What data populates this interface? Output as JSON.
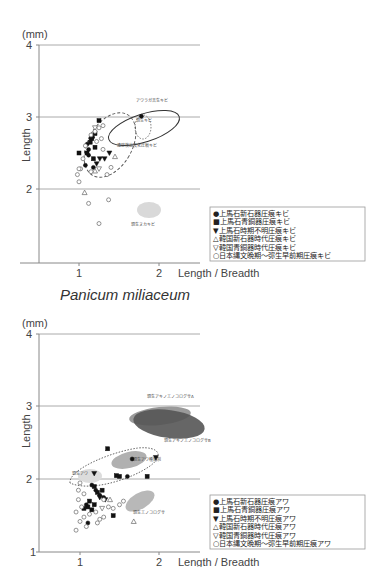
{
  "chart_data": [
    {
      "type": "scatter",
      "title": "Panicum miliaceum",
      "unit": "(mm)",
      "xlabel": "Length / Breadth",
      "ylabel": "Length",
      "xlim": [
        0.5,
        2.5
      ],
      "ylim": [
        1,
        4
      ],
      "xticks": [
        "1",
        "2"
      ],
      "yticks": [
        "4",
        "3",
        "2"
      ],
      "grid": "horizontal at 2, 3, 4",
      "legend_position": "right-lower",
      "legend": [
        "●上馬石新石器圧痕キビ",
        "■上馬石青銅器圧痕キビ",
        "▼上馬石時期不明圧痕キビ",
        "△韓国新石器時代圧痕キビ",
        "▽韓国青銅器時代圧痕キビ",
        "○日本縄文晩期～弥生早前期圧痕キビ"
      ],
      "annotations": [
        {
          "text": "アワラガ吉生キビ",
          "type": "solid ellipse",
          "cx": 1.75,
          "cy": 2.92,
          "rx": 0.36,
          "ry": 0.2
        },
        {
          "text": "現生キビ",
          "type": "dotted ellipse",
          "cx": 1.78,
          "cy": 2.87,
          "rx": 0.09,
          "ry": 0.16
        },
        {
          "text": "遺跡検出炭化圧痕キビ",
          "type": "dashed ellipse",
          "cx": 1.38,
          "cy": 2.6,
          "rx": 0.32,
          "ry": 0.38
        },
        {
          "text": "現生ヌカキビ",
          "type": "filled grey ellipse",
          "cx": 1.88,
          "cy": 1.75,
          "rx": 0.12,
          "ry": 0.07
        }
      ],
      "series": [
        {
          "name": "上馬石新石器圧痕キビ",
          "marker": "filled-circle",
          "points": [
            [
              1.78,
              3.01
            ],
            [
              1.12,
              2.47
            ],
            [
              1.18,
              2.3
            ],
            [
              1.1,
              2.62
            ],
            [
              1.15,
              2.7
            ],
            [
              1.17,
              2.72
            ],
            [
              1.12,
              2.55
            ],
            [
              1.08,
              2.33
            ]
          ]
        },
        {
          "name": "上馬石青銅器圧痕キビ",
          "marker": "filled-square",
          "points": [
            [
              1.25,
              2.95
            ],
            [
              1.2,
              2.77
            ],
            [
              1.16,
              2.7
            ],
            [
              1.14,
              2.65
            ],
            [
              1.1,
              2.5
            ],
            [
              1.2,
              2.58
            ],
            [
              1.0,
              2.5
            ],
            [
              1.18,
              2.42
            ]
          ]
        },
        {
          "name": "上馬石時期不明圧痕キビ",
          "marker": "filled-triangle-down",
          "points": [
            [
              1.32,
              2.42
            ],
            [
              1.38,
              2.5
            ],
            [
              1.22,
              2.35
            ],
            [
              1.26,
              2.42
            ]
          ]
        },
        {
          "name": "韓国新石器時代圧痕キビ",
          "marker": "open-triangle-up",
          "points": [
            [
              1.07,
              1.95
            ],
            [
              1.45,
              2.45
            ],
            [
              1.2,
              2.25
            ]
          ]
        },
        {
          "name": "韓国青銅器時代圧痕キビ",
          "marker": "open-triangle-down",
          "points": [
            [
              1.2,
              2.85
            ],
            [
              1.25,
              2.28
            ]
          ]
        },
        {
          "name": "日本縄文晩期～弥生早前期圧痕キビ",
          "marker": "open-circle",
          "points": [
            [
              1.25,
              2.85
            ],
            [
              1.3,
              2.88
            ],
            [
              1.2,
              2.8
            ],
            [
              1.15,
              2.75
            ],
            [
              1.28,
              2.7
            ],
            [
              1.22,
              2.66
            ],
            [
              1.05,
              2.42
            ],
            [
              1.02,
              2.28
            ],
            [
              1.0,
              2.28
            ],
            [
              0.98,
              2.2
            ],
            [
              1.15,
              2.24
            ],
            [
              1.3,
              2.55
            ],
            [
              1.35,
              2.2
            ],
            [
              1.08,
              2.6
            ],
            [
              1.0,
              2.1
            ],
            [
              1.12,
              1.8
            ],
            [
              1.37,
              1.85
            ],
            [
              1.25,
              1.52
            ],
            [
              1.4,
              2.3
            ]
          ]
        }
      ]
    },
    {
      "type": "scatter",
      "title": "",
      "unit": "(mm)",
      "xlabel": "Length / Breadth",
      "ylabel": "Length",
      "xlim": [
        0.5,
        2.5
      ],
      "ylim": [
        1,
        4
      ],
      "xticks": [
        "1",
        "2"
      ],
      "yticks": [
        "4",
        "3",
        "2",
        "1"
      ],
      "grid": "horizontal at 2, 3, 4",
      "legend_position": "right-lower",
      "legend": [
        "●上馬石新石器圧痕アワ",
        "■上馬石青銅器圧痕アワ",
        "▼上馬石時期不明圧痕アワ",
        "△韓国新石器時代圧痕アワ",
        "▽韓国青銅器時代圧痕アワ",
        "○日本縄文晩期～弥生早前期圧痕アワ"
      ],
      "annotations": [
        {
          "text": "現生アキノエノコログサA",
          "type": "filled grey ellipse",
          "cx": 1.96,
          "cy": 2.85,
          "rx": 0.3,
          "ry": 0.12
        },
        {
          "text": "現生アキノエノコログサB",
          "type": "filled dark ellipse",
          "cx": 2.07,
          "cy": 2.72,
          "rx": 0.37,
          "ry": 0.17
        },
        {
          "text": "現生アワ",
          "type": "filled light ellipse",
          "cx": 1.13,
          "cy": 2.05,
          "rx": 0.14,
          "ry": 0.09
        },
        {
          "text": "現生アワ種類別",
          "type": "filled grey ellipse",
          "cx": 1.6,
          "cy": 2.3,
          "rx": 0.2,
          "ry": 0.12
        },
        {
          "text": "",
          "type": "dotted envelope",
          "cx": 1.45,
          "cy": 2.2,
          "rx": 0.45,
          "ry": 0.2
        },
        {
          "text": "現生エノコログサ",
          "type": "filled grey ellipse",
          "cx": 1.75,
          "cy": 1.72,
          "rx": 0.17,
          "ry": 0.09
        }
      ],
      "series": [
        {
          "name": "上馬石新石器圧痕アワ",
          "marker": "filled-circle",
          "points": [
            [
              1.66,
              2.28
            ],
            [
              1.6,
              2.04
            ],
            [
              1.15,
              1.92
            ],
            [
              1.2,
              1.85
            ],
            [
              1.25,
              1.78
            ],
            [
              1.08,
              1.65
            ],
            [
              1.1,
              1.4
            ],
            [
              1.3,
              1.75
            ]
          ]
        },
        {
          "name": "上馬石青銅器圧痕アワ",
          "marker": "filled-square",
          "points": [
            [
              1.5,
              2.04
            ],
            [
              1.85,
              2.04
            ],
            [
              1.46,
              2.05
            ],
            [
              1.18,
              1.9
            ],
            [
              1.22,
              1.82
            ],
            [
              1.12,
              1.7
            ],
            [
              1.1,
              1.62
            ],
            [
              1.15,
              1.58
            ],
            [
              1.05,
              1.6
            ],
            [
              1.28,
              1.85
            ],
            [
              1.18,
              1.65
            ],
            [
              1.42,
              1.5
            ],
            [
              1.35,
              2.42
            ]
          ]
        },
        {
          "name": "上馬石時期不明圧痕アワ",
          "marker": "filled-triangle-down",
          "points": [
            [
              1.96,
              2.3
            ],
            [
              1.18,
              2.08
            ],
            [
              1.25,
              1.75
            ],
            [
              1.32,
              1.72
            ]
          ]
        },
        {
          "name": "韓国新石器時代圧痕アワ",
          "marker": "open-triangle-up",
          "points": [
            [
              1.38,
              1.72
            ],
            [
              1.68,
              1.42
            ]
          ]
        },
        {
          "name": "韓国青銅器時代圧痕アワ",
          "marker": "open-triangle-down",
          "points": [
            [
              1.28,
              1.6
            ]
          ]
        },
        {
          "name": "日本縄文晩期～弥生早前期圧痕アワ",
          "marker": "open-circle",
          "points": [
            [
              1.0,
              1.95
            ],
            [
              0.98,
              1.85
            ],
            [
              1.05,
              1.8
            ],
            [
              0.98,
              1.72
            ],
            [
              1.02,
              1.62
            ],
            [
              0.95,
              1.55
            ],
            [
              1.05,
              1.48
            ],
            [
              1.0,
              1.42
            ],
            [
              0.95,
              1.3
            ],
            [
              1.25,
              1.45
            ],
            [
              1.3,
              1.48
            ],
            [
              1.22,
              1.4
            ],
            [
              1.36,
              1.62
            ],
            [
              1.3,
              1.72
            ],
            [
              1.55,
              1.7
            ],
            [
              1.5,
              1.65
            ],
            [
              1.12,
              1.52
            ],
            [
              1.08,
              1.35
            ],
            [
              1.42,
              1.6
            ],
            [
              1.2,
              1.55
            ]
          ]
        }
      ]
    }
  ],
  "labels": {
    "top_unit": "(mm)",
    "top_y4": "4",
    "top_y3": "3",
    "top_y2": "2",
    "top_x1": "1",
    "top_x2": "2",
    "top_xlabel": "Length / Breadth",
    "top_ylabel": "Length",
    "species_name": "Panicum miliaceum",
    "bot_unit": "(mm)",
    "bot_y4": "4",
    "bot_y3": "3",
    "bot_y2": "2",
    "bot_y1": "1",
    "bot_x1": "1",
    "bot_x2": "2",
    "bot_xlabel": "Length / Breadth",
    "bot_ylabel": "Length",
    "top_ann": [
      "アワラガ吉生キビ",
      "現生キビ",
      "遺跡検出炭化圧痕キビ",
      "現生ヌカキビ"
    ],
    "bot_ann": [
      "現生アキノエノコログサA",
      "現生アキノエノコログサB",
      "現生アワ",
      "現生アワ種類別",
      "現生エノコログサ"
    ],
    "top_legend": [
      "●上馬石新石器圧痕キビ",
      "■上馬石青銅器圧痕キビ",
      "▼上馬石時期不明圧痕キビ",
      "△韓国新石器時代圧痕キビ",
      "▽韓国青銅器時代圧痕キビ",
      "○日本縄文晩期～弥生早前期圧痕キビ"
    ],
    "bot_legend": [
      "●上馬石新石器圧痕アワ",
      "■上馬石青銅器圧痕アワ",
      "▼上馬石時期不明圧痕アワ",
      "△韓国新石器時代圧痕アワ",
      "▽韓国青銅器時代圧痕アワ",
      "○日本縄文晩期～弥生早前期圧痕アワ"
    ]
  }
}
